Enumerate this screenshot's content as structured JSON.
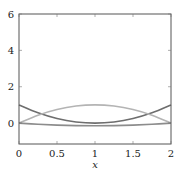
{
  "chart_data": {
    "type": "line",
    "title": "",
    "xlabel": "x",
    "ylabel": "",
    "xlim": [
      0,
      2
    ],
    "ylim": [
      -1.15,
      6
    ],
    "grid": false,
    "legend": null,
    "x_ticks": [
      0,
      0.5,
      1,
      1.5,
      2
    ],
    "x_tick_labels": [
      "0",
      "0.5",
      "1",
      "1.5",
      "2"
    ],
    "y_ticks": [
      0,
      2,
      4,
      6
    ],
    "y_tick_labels": [
      "0",
      "2",
      "4",
      "6"
    ],
    "x": [
      0,
      0.25,
      0.5,
      0.75,
      1,
      1.25,
      1.5,
      1.75,
      2
    ],
    "series": [
      {
        "name": "curve-dark",
        "color": "#6e6e6e",
        "values": [
          1,
          0.5625,
          0.25,
          0.0625,
          0,
          0.0625,
          0.25,
          0.5625,
          1
        ]
      },
      {
        "name": "curve-light",
        "color": "#b4b4b4",
        "values": [
          0,
          0.4375,
          0.75,
          0.9375,
          1,
          0.9375,
          0.75,
          0.4375,
          0
        ]
      },
      {
        "name": "curve-mid",
        "color": "#8c8c8c",
        "values": [
          0,
          -0.066,
          -0.113,
          -0.141,
          -0.15,
          -0.141,
          -0.113,
          -0.066,
          0
        ]
      }
    ]
  }
}
